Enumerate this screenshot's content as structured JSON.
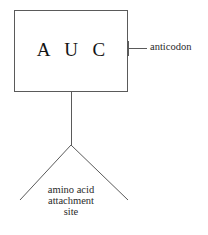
{
  "diagram": {
    "box": {
      "codon_text": "A U C",
      "x": 14,
      "y": 10,
      "width": 114,
      "height": 82,
      "stroke": "#5a5a5a",
      "fill": "#ffffff"
    },
    "labels": {
      "anticodon": "anticodon",
      "attachment_line1": "amino acid",
      "attachment_line2": "attachment",
      "attachment_line3": "site"
    },
    "lines": {
      "anticodon_leader": {
        "x1": 128,
        "y1": 48,
        "x2": 147,
        "y2": 48
      },
      "anticodon_tick": {
        "x1": 128,
        "y1": 41,
        "x2": 128,
        "y2": 56
      },
      "stem": {
        "x1": 71,
        "y1": 92,
        "x2": 71,
        "y2": 145
      },
      "arm_left": {
        "x1": 71,
        "y1": 145,
        "x2": 20,
        "y2": 200
      },
      "arm_right": {
        "x1": 71,
        "y1": 145,
        "x2": 128,
        "y2": 200
      }
    },
    "colors": {
      "stroke": "#5a5a5a",
      "text": "#1c1c1c",
      "background": "#ffffff"
    }
  }
}
